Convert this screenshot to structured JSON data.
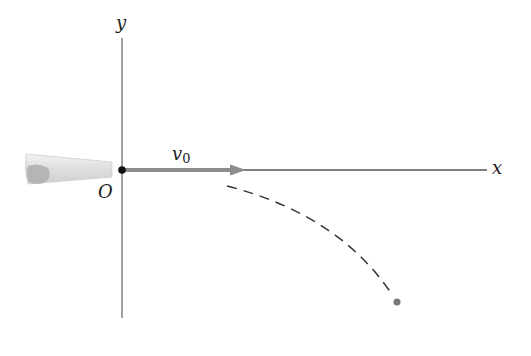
{
  "diagram": {
    "axes": {
      "x_label": "x",
      "y_label": "y",
      "origin_label": "O"
    },
    "velocity": {
      "symbol": "v",
      "subscript": "0"
    },
    "colors": {
      "axis": "#8a8a8a",
      "x_axis": "#555555",
      "arrow": "#8c8c8c",
      "trajectory": "#333333",
      "origin_dot": "#111111",
      "end_dot": "#777777",
      "cannon_light": "#e6e6e6",
      "cannon_dark": "#b5b5b5"
    }
  }
}
